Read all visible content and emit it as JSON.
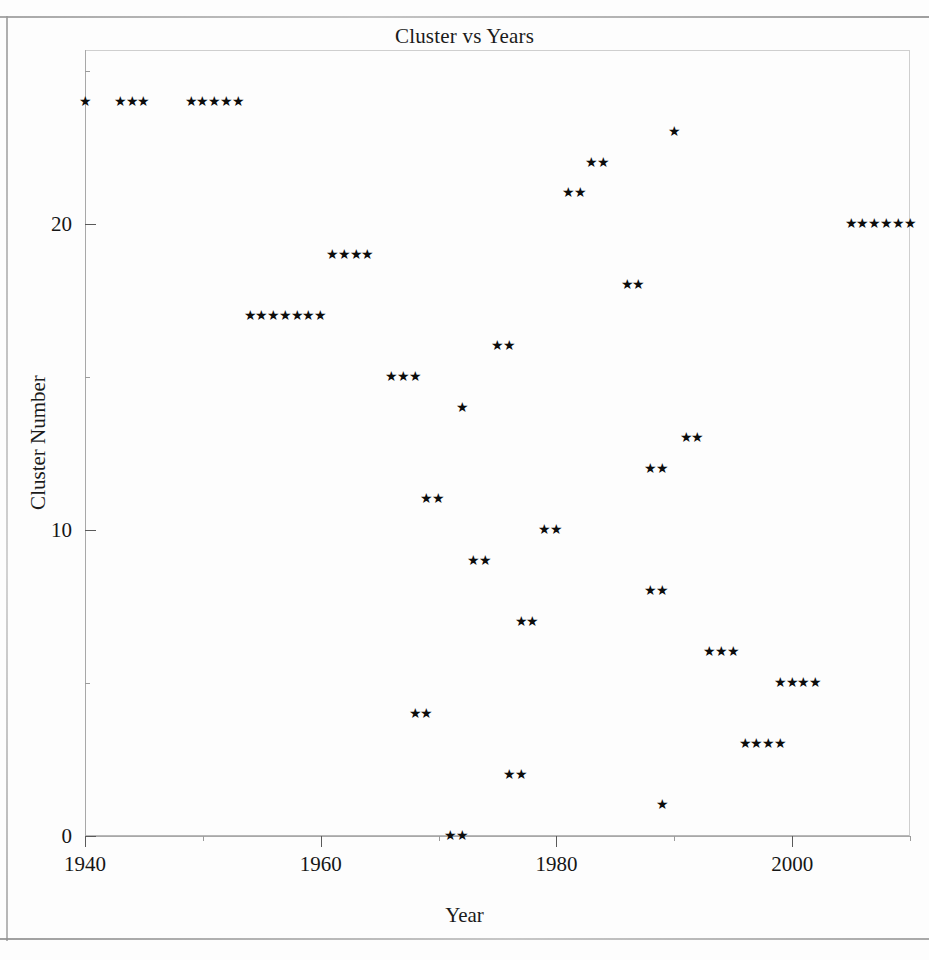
{
  "chart_data": {
    "type": "scatter",
    "title": "Cluster vs Years",
    "xlabel": "Year",
    "ylabel": "Cluster Number",
    "marker": "star",
    "grid": false,
    "legend": null,
    "xlim": [
      1940,
      2010
    ],
    "ylim": [
      -1,
      25
    ],
    "xticks": [
      1940,
      1960,
      1980,
      2000
    ],
    "xticks_minor": [
      1950,
      1970,
      1990,
      2010
    ],
    "yticks": [
      0,
      10,
      20
    ],
    "yticks_minor": [
      5,
      15,
      25
    ],
    "xtick_labels": [
      "1940",
      "1960",
      "1980",
      "2000"
    ],
    "ytick_labels": [
      "0",
      "10",
      "20"
    ],
    "series": [
      {
        "name": "clusters",
        "points": [
          {
            "x": 1940,
            "y": 24
          },
          {
            "x": 1943,
            "y": 24
          },
          {
            "x": 1944,
            "y": 24
          },
          {
            "x": 1945,
            "y": 24
          },
          {
            "x": 1949,
            "y": 24
          },
          {
            "x": 1950,
            "y": 24
          },
          {
            "x": 1951,
            "y": 24
          },
          {
            "x": 1952,
            "y": 24
          },
          {
            "x": 1953,
            "y": 24
          },
          {
            "x": 1990,
            "y": 23
          },
          {
            "x": 1983,
            "y": 22
          },
          {
            "x": 1984,
            "y": 22
          },
          {
            "x": 1981,
            "y": 21
          },
          {
            "x": 1982,
            "y": 21
          },
          {
            "x": 2005,
            "y": 20
          },
          {
            "x": 2006,
            "y": 20
          },
          {
            "x": 2007,
            "y": 20
          },
          {
            "x": 2008,
            "y": 20
          },
          {
            "x": 2009,
            "y": 20
          },
          {
            "x": 2010,
            "y": 20
          },
          {
            "x": 1961,
            "y": 19
          },
          {
            "x": 1962,
            "y": 19
          },
          {
            "x": 1963,
            "y": 19
          },
          {
            "x": 1964,
            "y": 19
          },
          {
            "x": 1986,
            "y": 18
          },
          {
            "x": 1987,
            "y": 18
          },
          {
            "x": 1954,
            "y": 17
          },
          {
            "x": 1955,
            "y": 17
          },
          {
            "x": 1956,
            "y": 17
          },
          {
            "x": 1957,
            "y": 17
          },
          {
            "x": 1958,
            "y": 17
          },
          {
            "x": 1959,
            "y": 17
          },
          {
            "x": 1960,
            "y": 17
          },
          {
            "x": 1975,
            "y": 16
          },
          {
            "x": 1976,
            "y": 16
          },
          {
            "x": 1966,
            "y": 15
          },
          {
            "x": 1967,
            "y": 15
          },
          {
            "x": 1968,
            "y": 15
          },
          {
            "x": 1972,
            "y": 14
          },
          {
            "x": 1991,
            "y": 13
          },
          {
            "x": 1992,
            "y": 13
          },
          {
            "x": 1988,
            "y": 12
          },
          {
            "x": 1989,
            "y": 12
          },
          {
            "x": 1969,
            "y": 11
          },
          {
            "x": 1970,
            "y": 11
          },
          {
            "x": 1979,
            "y": 10
          },
          {
            "x": 1980,
            "y": 10
          },
          {
            "x": 1973,
            "y": 9
          },
          {
            "x": 1974,
            "y": 9
          },
          {
            "x": 1988,
            "y": 8
          },
          {
            "x": 1989,
            "y": 8
          },
          {
            "x": 1977,
            "y": 7
          },
          {
            "x": 1978,
            "y": 7
          },
          {
            "x": 1993,
            "y": 6
          },
          {
            "x": 1994,
            "y": 6
          },
          {
            "x": 1995,
            "y": 6
          },
          {
            "x": 1999,
            "y": 5
          },
          {
            "x": 2000,
            "y": 5
          },
          {
            "x": 2001,
            "y": 5
          },
          {
            "x": 2002,
            "y": 5
          },
          {
            "x": 1968,
            "y": 4
          },
          {
            "x": 1969,
            "y": 4
          },
          {
            "x": 1996,
            "y": 3
          },
          {
            "x": 1997,
            "y": 3
          },
          {
            "x": 1998,
            "y": 3
          },
          {
            "x": 1999,
            "y": 3
          },
          {
            "x": 1976,
            "y": 2
          },
          {
            "x": 1977,
            "y": 2
          },
          {
            "x": 1989,
            "y": 1
          },
          {
            "x": 1971,
            "y": 0
          },
          {
            "x": 1972,
            "y": 0
          }
        ]
      }
    ]
  },
  "marker_glyph": "★",
  "geometry": {
    "plot_left": 85,
    "plot_right": 910,
    "plot_top": 50,
    "plot_bottom": 836,
    "x_min_year": 1940,
    "x_max_year": 2010,
    "y_px_per_unit": 30.6,
    "y_zero_px": 836
  }
}
